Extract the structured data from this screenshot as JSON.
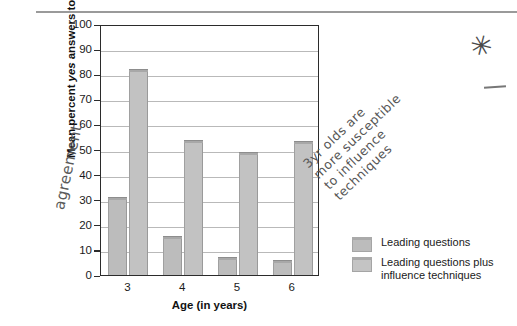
{
  "chart_data": {
    "type": "bar",
    "title": "",
    "xlabel": "Age (in years)",
    "ylabel": "Mean percent yes answers to misleading questions",
    "ylabel_italic_word": "yes",
    "categories": [
      "3",
      "4",
      "5",
      "6"
    ],
    "ylim": [
      0,
      100
    ],
    "yticks": [
      0,
      10,
      20,
      30,
      40,
      50,
      60,
      70,
      80,
      90,
      100
    ],
    "grid": true,
    "legend_position": "right",
    "series": [
      {
        "name": "Leading questions",
        "values": [
          31,
          15.5,
          7,
          6
        ]
      },
      {
        "name": "Leading questions plus influence techniques",
        "values": [
          82,
          54,
          49,
          53.5
        ]
      }
    ],
    "colors": {
      "series1": "#bcbcbc",
      "series2": "#c2c2c2",
      "axis": "#2b2b2b",
      "grid": "#b9b9b9"
    }
  },
  "legend": {
    "items": [
      {
        "label": "Leading questions"
      },
      {
        "label_line1": "Leading questions plus",
        "label_line2": "influence techniques"
      }
    ]
  },
  "annotations": {
    "left_handwriting": "agreement",
    "right_handwriting_line1": "3yr olds are",
    "right_handwriting_line2": "more susceptible",
    "right_handwriting_line3": "to influence",
    "right_handwriting_line4": "techniques",
    "star_mark": "✳"
  },
  "axis_labels": {
    "y": [
      "100",
      "90",
      "80",
      "70",
      "60",
      "50",
      "40",
      "30",
      "20",
      "10",
      "0"
    ],
    "x": [
      "3",
      "4",
      "5",
      "6"
    ]
  }
}
